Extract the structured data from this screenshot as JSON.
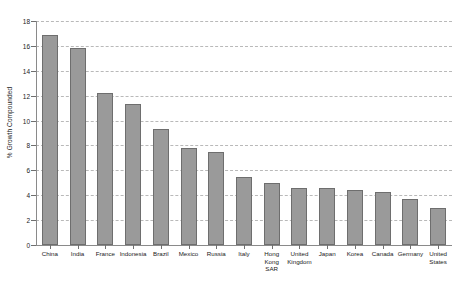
{
  "chart_data": {
    "type": "bar",
    "title": "",
    "subtitle": "",
    "xlabel": "",
    "ylabel": "% Growth Compounded",
    "ylim": [
      0,
      18
    ],
    "ytick_step": 2,
    "yticks": [
      "0",
      "2",
      "4",
      "6",
      "8",
      "10",
      "12",
      "14",
      "16",
      "18"
    ],
    "grid": true,
    "grid_axis": "y",
    "legend": false,
    "legend_position": "none",
    "bar_color": "#9a9a9a",
    "bar_edge_color": "#6e6e6e",
    "grid_color": "#b9b9b9",
    "axis_color": "#8a8a8a",
    "categories": [
      "China",
      "India",
      "France",
      "Indonesia",
      "Brazil",
      "Mexico",
      "Russia",
      "Italy",
      "Hong Kong SAR",
      "United Kingdom",
      "Japan",
      "Korea",
      "Canada",
      "Germany",
      "United States"
    ],
    "values": [
      16.9,
      15.8,
      12.2,
      11.3,
      9.3,
      7.8,
      7.5,
      5.5,
      5.0,
      4.6,
      4.6,
      4.4,
      4.3,
      3.7,
      3.0
    ]
  }
}
